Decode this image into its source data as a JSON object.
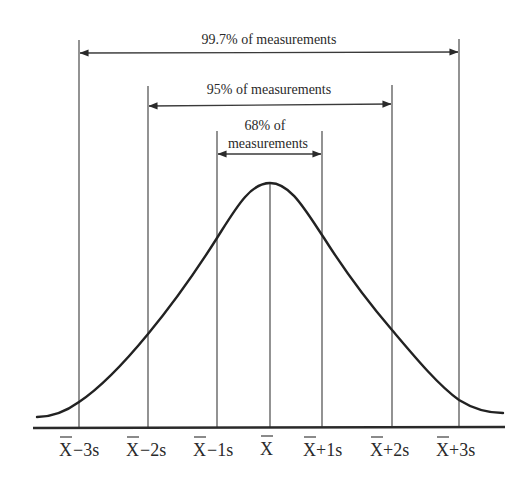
{
  "diagram": {
    "ranges": [
      {
        "id": "range-99-7",
        "label": "99.7% of measurements",
        "from": "-3s",
        "to": "+3s"
      },
      {
        "id": "range-95",
        "label": "95% of measurements",
        "from": "-2s",
        "to": "+2s"
      },
      {
        "id": "range-68",
        "label_line1": "68% of",
        "label_line2": "measurements",
        "from": "-1s",
        "to": "+1s"
      }
    ],
    "axis_labels": [
      {
        "bar": "X",
        "suffix": "−3s"
      },
      {
        "bar": "X",
        "suffix": "−2s"
      },
      {
        "bar": "X",
        "suffix": "−1s"
      },
      {
        "bar": "X",
        "suffix": ""
      },
      {
        "bar": "X",
        "suffix": "+1s"
      },
      {
        "bar": "X",
        "suffix": "+2s"
      },
      {
        "bar": "X",
        "suffix": "+3s"
      }
    ],
    "colors": {
      "ink": "#2a2a2a",
      "background": "#ffffff"
    }
  }
}
